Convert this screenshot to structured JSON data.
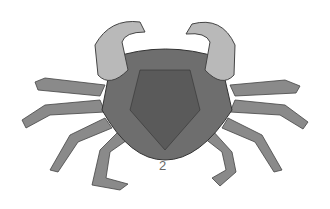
{
  "figure": {
    "label": "2",
    "colors": {
      "body": "#6e6e6e",
      "claw": "#b9b9b9",
      "legs": "#8a8a8a",
      "background": "#ffffff"
    }
  }
}
